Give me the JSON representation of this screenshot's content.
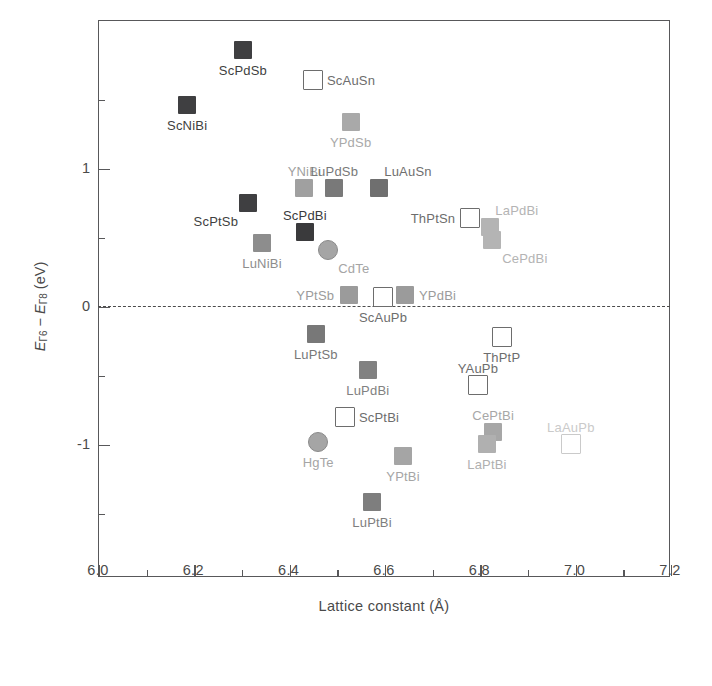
{
  "chart_data": {
    "type": "scatter",
    "title": "",
    "xlabel": "Lattice constant (Å)",
    "ylabel": "EΓ6 − EΓ8 (eV)",
    "xlim": [
      6.0,
      7.2
    ],
    "ylim": [
      -1.55,
      2.05
    ],
    "grid": false,
    "legend": "none",
    "xticks": [
      6.0,
      6.2,
      6.4,
      6.6,
      6.8,
      7.0,
      7.2
    ],
    "xtick_labels": [
      "6.0",
      "6.2",
      "6.4",
      "6.6",
      "6.8",
      "7.0",
      "7.2"
    ],
    "xminor_step": 0.1,
    "yticks": [
      1,
      0,
      -1
    ],
    "ytick_labels": [
      "1",
      "0",
      "-1"
    ],
    "yminor_ticks": [
      0.5,
      -0.5
    ],
    "annotations": [
      {
        "text": "zero reference line at y = 0",
        "style": "dashed-horizontal"
      }
    ],
    "points": [
      {
        "label": "ScPdSb",
        "x": 6.304,
        "y": 1.855,
        "marker": "filled-square",
        "color": "#3f3f41",
        "label_pos": "below"
      },
      {
        "label": "ScNiBi",
        "x": 6.187,
        "y": 1.457,
        "marker": "filled-square",
        "color": "#3f3f41",
        "label_pos": "below"
      },
      {
        "label": "ScAuSn",
        "x": 6.451,
        "y": 1.638,
        "marker": "open-square",
        "color": "#6d6d6d",
        "label_pos": "right"
      },
      {
        "label": "YPdSb",
        "x": 6.53,
        "y": 1.333,
        "marker": "filled-square",
        "color": "#a9a9a9",
        "label_pos": "below"
      },
      {
        "label": "YNiBi",
        "x": 6.433,
        "y": 0.855,
        "marker": "filled-square",
        "color": "#a0a0a0",
        "label_pos": "above"
      },
      {
        "label": "LuPdSb",
        "x": 6.496,
        "y": 0.855,
        "marker": "filled-square",
        "color": "#797979",
        "label_pos": "above"
      },
      {
        "label": "LuAuSn",
        "x": 6.59,
        "y": 0.855,
        "marker": "filled-square",
        "color": "#6f6f6f",
        "label_pos": "above-right"
      },
      {
        "label": "ScPtSb",
        "x": 6.315,
        "y": 0.743,
        "marker": "filled-square",
        "color": "#3f3f41",
        "label_pos": "below-left"
      },
      {
        "label": "ScPdBi",
        "x": 6.434,
        "y": 0.533,
        "marker": "filled-square",
        "color": "#3a3a3c",
        "label_pos": "above"
      },
      {
        "label": "LuNiBi",
        "x": 6.344,
        "y": 0.457,
        "marker": "filled-square",
        "color": "#8d8d8d",
        "label_pos": "below"
      },
      {
        "label": "CdTe",
        "x": 6.483,
        "y": 0.406,
        "marker": "filled-circle",
        "color": "#a5a5a5",
        "label_pos": "below-right"
      },
      {
        "label": "ThPtSn",
        "x": 6.781,
        "y": 0.638,
        "marker": "open-square",
        "color": "#6d6d6d",
        "label_pos": "left"
      },
      {
        "label": "LaPdBi",
        "x": 6.823,
        "y": 0.572,
        "marker": "filled-square",
        "color": "#b4b4b4",
        "label_pos": "above-right"
      },
      {
        "label": "CePdBi",
        "x": 6.827,
        "y": 0.478,
        "marker": "filled-square",
        "color": "#b4b4b4",
        "label_pos": "below-right"
      },
      {
        "label": "YPtSb",
        "x": 6.527,
        "y": 0.08,
        "marker": "filled-square",
        "color": "#9b9b9b",
        "label_pos": "left"
      },
      {
        "label": "ScAuPb",
        "x": 6.598,
        "y": 0.065,
        "marker": "open-square",
        "color": "#6d6d6d",
        "label_pos": "below"
      },
      {
        "label": "YPdBi",
        "x": 6.644,
        "y": 0.08,
        "marker": "filled-square",
        "color": "#9b9b9b",
        "label_pos": "right"
      },
      {
        "label": "LuPtSb",
        "x": 6.457,
        "y": -0.203,
        "marker": "filled-square",
        "color": "#787878",
        "label_pos": "below"
      },
      {
        "label": "LuPdBi",
        "x": 6.566,
        "y": -0.464,
        "marker": "filled-square",
        "color": "#818181",
        "label_pos": "below"
      },
      {
        "label": "ThPtP",
        "x": 6.847,
        "y": -0.225,
        "marker": "open-square",
        "color": "#6d6d6d",
        "label_pos": "below"
      },
      {
        "label": "YAuPb",
        "x": 6.797,
        "y": -0.572,
        "marker": "open-square",
        "color": "#6d6d6d",
        "label_pos": "above"
      },
      {
        "label": "ScPtBi",
        "x": 6.518,
        "y": -0.804,
        "marker": "open-square",
        "color": "#6d6d6d",
        "label_pos": "right"
      },
      {
        "label": "HgTe",
        "x": 6.462,
        "y": -0.986,
        "marker": "filled-circle",
        "color": "#a5a5a5",
        "label_pos": "below"
      },
      {
        "label": "CePtBi",
        "x": 6.829,
        "y": -0.913,
        "marker": "filled-square",
        "color": "#a7a7a7",
        "label_pos": "above"
      },
      {
        "label": "LaPtBi",
        "x": 6.816,
        "y": -1.0,
        "marker": "filled-square",
        "color": "#b0b0b0",
        "label_pos": "below"
      },
      {
        "label": "YPtBi",
        "x": 6.64,
        "y": -1.087,
        "marker": "filled-square",
        "color": "#a5a5a5",
        "label_pos": "below"
      },
      {
        "label": "LuPtBi",
        "x": 6.575,
        "y": -1.42,
        "marker": "filled-square",
        "color": "#7e7e7e",
        "label_pos": "below"
      },
      {
        "label": "LaAuPb",
        "x": 6.992,
        "y": -1.0,
        "marker": "open-square",
        "color": "#cacaca",
        "label_pos": "above"
      }
    ]
  }
}
